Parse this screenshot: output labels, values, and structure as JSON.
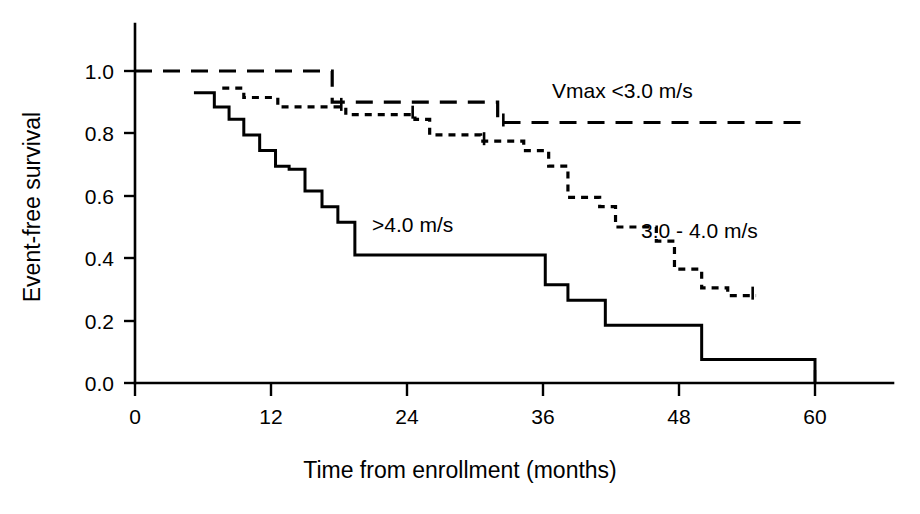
{
  "chart_data": {
    "type": "line",
    "title": "",
    "subtitle": "",
    "xlabel": "Time from enrollment (months)",
    "ylabel": "Event-free survival",
    "xlim": [
      0,
      63
    ],
    "ylim": [
      0.0,
      1.08
    ],
    "xticks": [
      0,
      12,
      24,
      36,
      48,
      60
    ],
    "xticklabels": [
      "0",
      "12",
      "24",
      "36",
      "48",
      "60"
    ],
    "yticks": [
      0.0,
      0.2,
      0.4,
      0.6,
      0.8,
      1.0
    ],
    "yticklabels": [
      "0.0",
      "0.2",
      "0.4",
      "0.6",
      "0.8",
      "1.0"
    ],
    "grid": false,
    "legend_position": "inline-annotations",
    "plot_style": "kaplan-meier step curves",
    "series": [
      {
        "name": "Vmax <3.0 m/s",
        "linestyle": "dashed",
        "color": "#000000",
        "label_x": 43.0,
        "label_y": 0.915,
        "steps": [
          [
            0.0,
            1.0
          ],
          [
            17.4,
            1.0
          ],
          [
            17.4,
            0.9
          ],
          [
            32.0,
            0.9
          ],
          [
            32.0,
            0.835
          ],
          [
            59.0,
            0.835
          ]
        ],
        "censor_times": [
          32.5
        ]
      },
      {
        "name": "3.0 - 4.0 m/s",
        "linestyle": "dotted",
        "color": "#000000",
        "label_x": 49.8,
        "label_y": 0.465,
        "steps": [
          [
            7.7,
            0.945
          ],
          [
            9.6,
            0.945
          ],
          [
            9.6,
            0.915
          ],
          [
            12.6,
            0.915
          ],
          [
            12.6,
            0.885
          ],
          [
            18.6,
            0.885
          ],
          [
            18.6,
            0.86
          ],
          [
            24.7,
            0.86
          ],
          [
            24.7,
            0.845
          ],
          [
            26.0,
            0.845
          ],
          [
            26.0,
            0.795
          ],
          [
            30.5,
            0.795
          ],
          [
            30.5,
            0.775
          ],
          [
            34.3,
            0.775
          ],
          [
            34.3,
            0.745
          ],
          [
            36.5,
            0.745
          ],
          [
            36.5,
            0.695
          ],
          [
            38.2,
            0.695
          ],
          [
            38.2,
            0.595
          ],
          [
            41.0,
            0.595
          ],
          [
            41.0,
            0.565
          ],
          [
            42.4,
            0.565
          ],
          [
            42.4,
            0.5
          ],
          [
            46.0,
            0.5
          ],
          [
            46.0,
            0.455
          ],
          [
            47.6,
            0.455
          ],
          [
            47.6,
            0.365
          ],
          [
            50.0,
            0.365
          ],
          [
            50.0,
            0.305
          ],
          [
            52.3,
            0.305
          ],
          [
            52.3,
            0.28
          ],
          [
            54.8,
            0.28
          ]
        ],
        "censor_times": [
          18.2,
          24.5,
          30.8,
          54.5
        ]
      },
      {
        "name": ">4.0 m/s",
        "linestyle": "solid",
        "color": "#000000",
        "label_x": 24.5,
        "label_y": 0.485,
        "steps": [
          [
            5.2,
            0.93
          ],
          [
            7.0,
            0.93
          ],
          [
            7.0,
            0.885
          ],
          [
            8.3,
            0.885
          ],
          [
            8.3,
            0.845
          ],
          [
            9.6,
            0.845
          ],
          [
            9.6,
            0.795
          ],
          [
            11.0,
            0.795
          ],
          [
            11.0,
            0.745
          ],
          [
            12.4,
            0.745
          ],
          [
            12.4,
            0.695
          ],
          [
            13.6,
            0.695
          ],
          [
            13.6,
            0.685
          ],
          [
            15.0,
            0.685
          ],
          [
            15.0,
            0.615
          ],
          [
            16.5,
            0.615
          ],
          [
            16.5,
            0.565
          ],
          [
            17.9,
            0.565
          ],
          [
            17.9,
            0.515
          ],
          [
            19.4,
            0.515
          ],
          [
            19.4,
            0.41
          ],
          [
            36.2,
            0.41
          ],
          [
            36.2,
            0.315
          ],
          [
            38.2,
            0.315
          ],
          [
            38.2,
            0.265
          ],
          [
            41.5,
            0.265
          ],
          [
            41.5,
            0.185
          ],
          [
            50.0,
            0.185
          ],
          [
            50.0,
            0.075
          ],
          [
            60.0,
            0.075
          ],
          [
            60.0,
            0.0
          ]
        ],
        "censor_times": []
      }
    ]
  },
  "axes": {
    "ylabel": "Event-free survival",
    "xlabel": "Time from enrollment (months)",
    "ytick_labels": [
      "1.0",
      "0.8",
      "0.6",
      "0.4",
      "0.2",
      "0.0"
    ],
    "xtick_labels": [
      "0",
      "12",
      "24",
      "36",
      "48",
      "60"
    ]
  },
  "annotations": [
    {
      "id": "vmax-low",
      "text": "Vmax <3.0 m/s"
    },
    {
      "id": "vmax-mid",
      "text": "3.0 - 4.0 m/s"
    },
    {
      "id": "vmax-high",
      "text": ">4.0 m/s"
    }
  ],
  "colors": {
    "ink": "#000000",
    "background": "#ffffff"
  }
}
